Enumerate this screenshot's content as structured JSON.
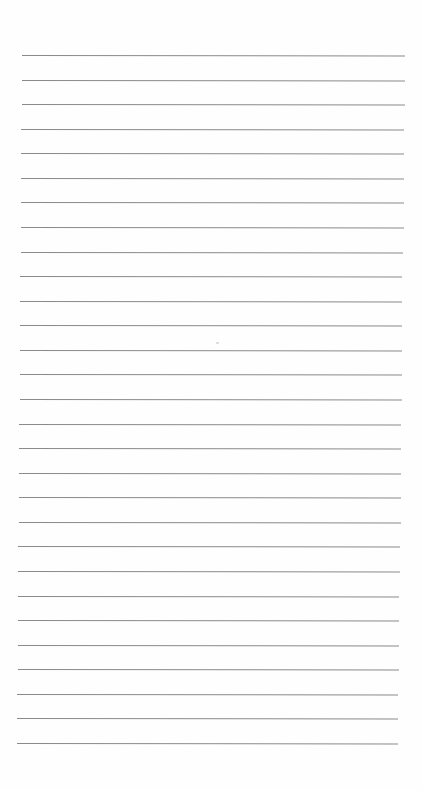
{
  "page": {
    "type": "ruled-paper",
    "background": "#fefefe",
    "line_color": "#8a8a8a",
    "line_count": 29,
    "first_line_y": 55,
    "last_line_y": 743,
    "line_spacing": 24.57,
    "left_start_x": 22,
    "right_end_x": 405,
    "bottom_left_x": 17,
    "bottom_right_x": 398,
    "text": []
  }
}
